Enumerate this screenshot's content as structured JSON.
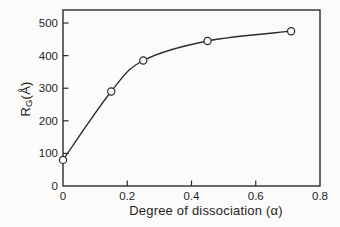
{
  "figure": {
    "background": "#fcfbf9",
    "ink": "#2b2b2b",
    "marker_fill": "#fcfbf9"
  },
  "chart_data": {
    "type": "line",
    "title": "",
    "xlabel": "Degree of dissociation (α)",
    "ylabel": {
      "pre": "R",
      "sub": "G",
      "post": "(Å)"
    },
    "x": [
      0,
      0.15,
      0.25,
      0.45,
      0.71
    ],
    "y": [
      80,
      290,
      385,
      445,
      475
    ],
    "xlim": [
      0,
      0.8
    ],
    "ylim": [
      0,
      540
    ],
    "x_ticks": [
      0,
      0.2,
      0.4,
      0.6,
      0.8
    ],
    "x_tick_labels": [
      "0",
      "0.2",
      "0.4",
      "0.6",
      "0.8"
    ],
    "y_ticks": [
      0,
      100,
      200,
      300,
      400,
      500
    ],
    "y_tick_labels": [
      "0",
      "100",
      "200",
      "300",
      "400",
      "500"
    ],
    "marker": "open-circle",
    "grid": false,
    "legend": null
  }
}
